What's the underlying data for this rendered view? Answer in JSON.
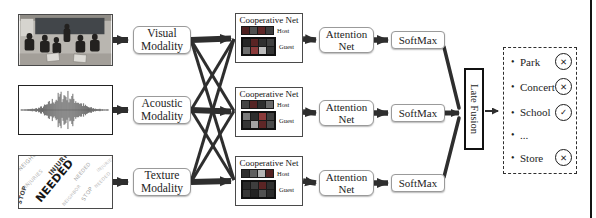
{
  "colors": {
    "arrow": "#2e2e2e",
    "box_border": "#9a9a9a",
    "coop_border": "#4a4a4a",
    "text": "#1d1d1d"
  },
  "diagram": {
    "bullet": "•",
    "inputs": {
      "texture": {
        "words": [
          "NEEDED",
          "INJURIES",
          "STOP",
          "NEIGHBOR"
        ]
      }
    },
    "modalities": [
      {
        "line1": "Visual",
        "line2": "Modality"
      },
      {
        "line1": "Acoustic",
        "line2": "Modality"
      },
      {
        "line1": "Texture",
        "line2": "Modality"
      }
    ],
    "cooperative_net": {
      "title": "Cooperative Net",
      "host_label": "Host",
      "guest_label": "Guest"
    },
    "nets": [
      {
        "host": [
          "#4d2020",
          "#4f4f4f",
          "#5e2626",
          "#3c3c3c"
        ],
        "guest": [
          "#262626",
          "#5a2424",
          "#303030",
          "#404040",
          "#6e6e6e",
          "#8c3b3b",
          "#bdbdbd",
          "#353535"
        ]
      },
      {
        "host": [
          "#454545",
          "#562323",
          "#2e2e2e",
          "#6a6a6a"
        ],
        "guest": [
          "#7a7a7a",
          "#2d2d2d",
          "#8c3b3b",
          "#3f3f3f",
          "#353535",
          "#a3a3a3",
          "#5e2626",
          "#4b4b4b"
        ]
      },
      {
        "host": [
          "#2e2e2e",
          "#5f5f5f",
          "#b5b5b5",
          "#542222"
        ],
        "guest": [
          "#282828",
          "#3e3e3e",
          "#5a2424",
          "#2f2f2f",
          "#383838",
          "#232323",
          "#515151",
          "#2b2b2b"
        ]
      }
    ],
    "attention": {
      "line1": "Attention",
      "line2": "Net"
    },
    "softmax_label": "SoftMax",
    "late_fusion_label": "Late Fusion",
    "outputs": [
      {
        "label": "Park",
        "mark": "✕"
      },
      {
        "label": "Concert",
        "mark": "✕"
      },
      {
        "label": "School",
        "mark": "✓"
      },
      {
        "label": "...",
        "mark": ""
      },
      {
        "label": "Store",
        "mark": "✕"
      }
    ]
  }
}
